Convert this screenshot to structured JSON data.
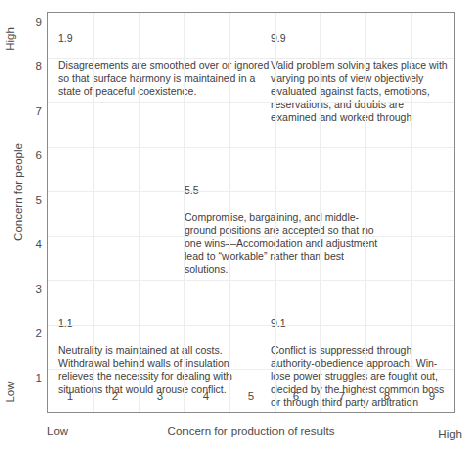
{
  "chart_data": {
    "type": "scatter",
    "title": "",
    "xlabel": "Concern for production of results",
    "ylabel": "Concern for people",
    "xlim": [
      0,
      9
    ],
    "ylim": [
      0,
      9
    ],
    "grid": true,
    "legend": "none",
    "x_ticks": [
      "1",
      "2",
      "3",
      "4",
      "5",
      "6",
      "7",
      "8",
      "9"
    ],
    "y_ticks": [
      "1",
      "2",
      "3",
      "4",
      "5",
      "6",
      "7",
      "8",
      "9"
    ],
    "x_low_label": "Low",
    "x_high_label": "High",
    "y_low_label": "Low",
    "y_high_label": "High",
    "annotations": [
      {
        "code": "1.9",
        "x": 1,
        "y": 9,
        "text": "Disagreements are smoothed over or ignored so that surface harmony is maintained in a state of peaceful coexistence."
      },
      {
        "code": "9.9",
        "x": 9,
        "y": 9,
        "text": "Valid problem solving takes place with varying points of view objectively evaluated against facts, emotions, reservations, and doubts are examined and worked through"
      },
      {
        "code": "5.5",
        "x": 5,
        "y": 5,
        "text": "Compromise, bargaining, and middle-ground positions are accepted so that no one wins—Accomodation and adjustment lead to “workable” rather than best solutions."
      },
      {
        "code": "1.1",
        "x": 1,
        "y": 1,
        "text": "Neutrality is maintained at all costs. Withdrawal behind walls of insulation relieves the necessity for dealing with situations that would arouse conflict."
      },
      {
        "code": "9.1",
        "x": 9,
        "y": 1,
        "text": "Conflict is suppressed through authority-obedience approach. Win-lose power struggles are fought out, decided by the highest common boss or through third party arbitration"
      }
    ]
  },
  "axes": {
    "x_title": "Concern for production of results",
    "y_title": "Concern for people",
    "x_low": "Low",
    "x_high": "High",
    "y_low": "Low",
    "y_high": "High"
  },
  "cells": {
    "top_left": {
      "code": "1.9",
      "text": "Disagreements are smoothed over or ignored so that surface harmony is maintained in a state of peaceful coexistence."
    },
    "top_right": {
      "code": "9.9",
      "text": "Valid problem solving takes place with varying points of view objectively evaluated against facts, emotions, reservations, and doubts are examined and worked through"
    },
    "center": {
      "code": "5.5",
      "text": "Compromise, bargaining, and middle-ground positions are accepted so that no one wins—Accomodation and adjustment lead to “workable” rather than best solutions."
    },
    "bottom_left": {
      "code": "1.1",
      "text": "Neutrality is maintained at all costs. Withdrawal behind walls of insulation relieves the necessity for dealing with situations that would arouse conflict."
    },
    "bottom_right": {
      "code": "9.1",
      "text": "Conflict is suppressed through authority-obedience approach. Win-lose power struggles are fought out, decided by the highest common boss or through third party arbitration"
    }
  },
  "colors": {
    "frame": "#8a8a8a",
    "gridline": "#ededed",
    "text": "#3d3d3d",
    "axis_text": "#4a4a4a",
    "background": "#ffffff"
  }
}
